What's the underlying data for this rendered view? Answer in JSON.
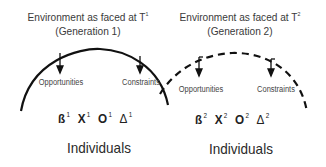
{
  "generations": [
    {
      "title_line1": "Environment as faced at T",
      "title_sup": "1",
      "title_line2": "(Generation 1)",
      "arc_style": "solid",
      "opportunities_label": "Opportunities",
      "constraints_label": "Constraints",
      "symbols": [
        {
          "char": "ß",
          "sup": "1"
        },
        {
          "char": "X",
          "sup": "1"
        },
        {
          "char": "O",
          "sup": "1"
        },
        {
          "char": "Δ",
          "sup": "1"
        }
      ],
      "individuals_label": "Individuals"
    },
    {
      "title_line1": "Environment as faced at T",
      "title_sup": "2",
      "title_line2": "(Generation 2)",
      "arc_style": "dashed",
      "opportunities_label": "Opportunities",
      "constraints_label": "Constraints",
      "symbols": [
        {
          "char": "ß",
          "sup": "2"
        },
        {
          "char": "X",
          "sup": "2"
        },
        {
          "char": "O",
          "sup": "2"
        },
        {
          "char": "Δ",
          "sup": "2"
        }
      ],
      "individuals_label": "Individuals"
    }
  ],
  "colors": {
    "line": "#111111",
    "text": "#333333",
    "background": "#ffffff"
  }
}
